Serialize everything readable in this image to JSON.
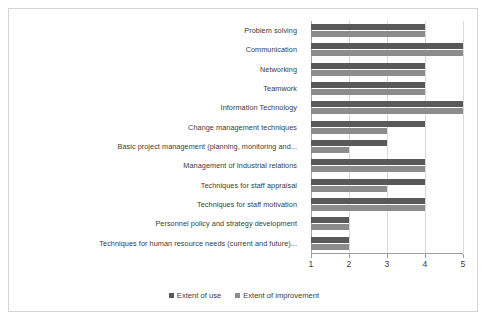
{
  "chart_data": {
    "type": "bar",
    "orientation": "horizontal",
    "title": "",
    "xlabel": "",
    "ylabel": "",
    "xlim": [
      1,
      5
    ],
    "xticks": [
      1,
      2,
      3,
      4,
      5
    ],
    "xticklabels": [
      "1",
      "2",
      "3",
      "4",
      "5"
    ],
    "grid": true,
    "legend_position": "bottom",
    "categories": [
      "Problem solving",
      "Communication",
      "Networking",
      "Teamwork",
      "Information Technology",
      "Change management techniques",
      "Basic project management (planning, monitoring and...",
      "Management of Industrial relations",
      "Techniques for staff appraisal",
      "Techniques for staff motivation",
      "Personnel policy and strategy development",
      "Techniques for human resource needs (current and future)..."
    ],
    "series": [
      {
        "name": "Extent of use",
        "color": "#595959",
        "values": [
          4,
          5,
          4,
          4,
          5,
          4,
          3,
          4,
          4,
          4,
          2,
          2
        ]
      },
      {
        "name": "Extent of improvement",
        "color": "#8c8c8c",
        "values": [
          4,
          5,
          4,
          4,
          5,
          3,
          2,
          4,
          3,
          4,
          2,
          2
        ]
      }
    ]
  },
  "legend": {
    "items": [
      {
        "label": "Extent of use"
      },
      {
        "label": "Extent of improvement"
      }
    ]
  },
  "colors": {
    "series_use": "#595959",
    "series_improve": "#8c8c8c",
    "gridline": "#d9d9d9",
    "axis": "#9d9d9d",
    "border": "#d4d4d4",
    "text": "#3b3b3b",
    "background": "#ffffff"
  }
}
